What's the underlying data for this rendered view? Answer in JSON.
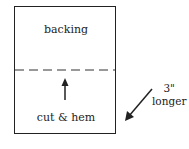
{
  "diagram": {
    "top_label": "backing",
    "bottom_label": "cut & hem",
    "side_label_line1": "3\"",
    "side_label_line2": "longer"
  }
}
